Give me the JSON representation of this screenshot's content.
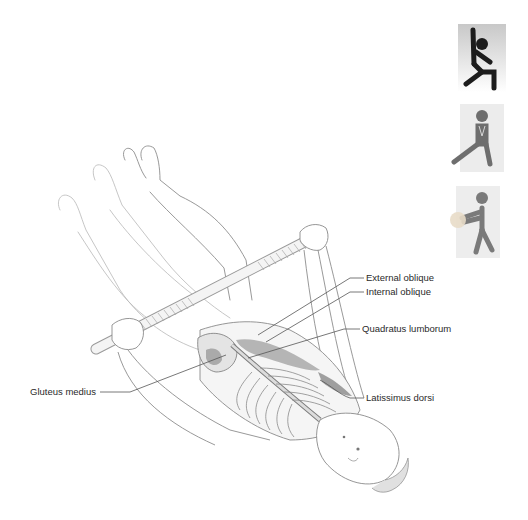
{
  "figure": {
    "type": "anatomical-exercise-illustration"
  },
  "labels": {
    "external_oblique": "External oblique",
    "internal_oblique": "Internal oblique",
    "quadratus_lumborum": "Quadratus lumborum",
    "latissimus_dorsi": "Latissimus dorsi",
    "gluteus_medius": "Gluteus medius"
  },
  "icons": [
    {
      "name": "flexibility-stretch-icon",
      "description": "figure with arm raised, lunging",
      "color": "#1c1c1c",
      "bg": "#cfcfcf"
    },
    {
      "name": "side-lunge-icon",
      "description": "figure in side lunge with hands clasped",
      "color": "#6e6e6e",
      "bg": "#e6e6e6"
    },
    {
      "name": "medicine-ball-icon",
      "description": "figure holding a ball",
      "color": "#7a7a7a",
      "bg": "#e9e9e9",
      "ball_color": "#e8dcc8"
    }
  ],
  "colors": {
    "line": "#6a6a6a",
    "sketch": "#9a9a9a",
    "text": "#2a2a2a",
    "muscle": "#7c7c7c"
  }
}
